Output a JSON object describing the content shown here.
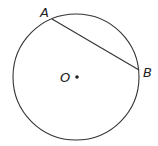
{
  "diagram": {
    "type": "circle-with-chord",
    "circle": {
      "cx": 76,
      "cy": 77,
      "r": 63,
      "stroke": "#333333"
    },
    "center": {
      "label": "O",
      "x": 77,
      "y": 77
    },
    "points": [
      {
        "label": "A",
        "x": 52,
        "y": 19
      },
      {
        "label": "B",
        "x": 139,
        "y": 70
      }
    ],
    "chord": {
      "from": "A",
      "to": "B"
    }
  }
}
